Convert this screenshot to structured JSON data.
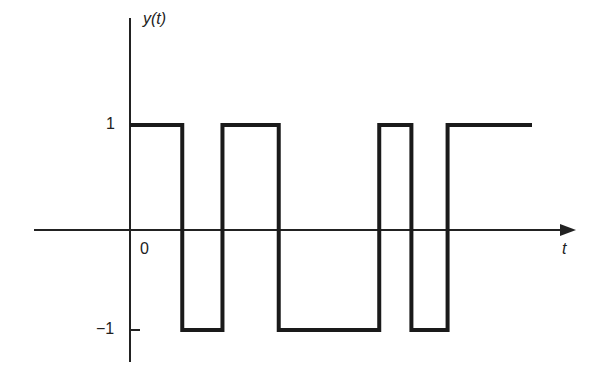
{
  "chart_data": {
    "type": "line",
    "title": "",
    "xlabel": "t",
    "ylabel": "y(t)",
    "ylim": [
      -1,
      1
    ],
    "yticks": [
      "1",
      "−1"
    ],
    "xticks": [
      "0"
    ],
    "grid": false,
    "legend": null,
    "segments": [
      {
        "t_start": 0.0,
        "t_end": 0.13,
        "value": 1
      },
      {
        "t_start": 0.13,
        "t_end": 0.23,
        "value": -1
      },
      {
        "t_start": 0.23,
        "t_end": 0.37,
        "value": 1
      },
      {
        "t_start": 0.37,
        "t_end": 0.62,
        "value": -1
      },
      {
        "t_start": 0.62,
        "t_end": 0.7,
        "value": 1
      },
      {
        "t_start": 0.7,
        "t_end": 0.79,
        "value": -1
      },
      {
        "t_start": 0.79,
        "t_end": 1.0,
        "value": 1
      }
    ]
  },
  "labels": {
    "y_axis": "y(t)",
    "x_axis": "t",
    "origin": "0",
    "tick_pos": "1",
    "tick_neg": "−1"
  }
}
